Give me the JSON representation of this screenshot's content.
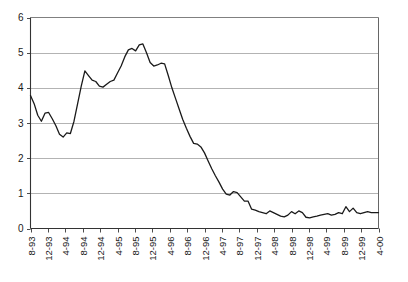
{
  "chart_data": {
    "type": "line",
    "title": "",
    "subtitle": "",
    "xlabel": "",
    "ylabel": "",
    "ylim": [
      0,
      6
    ],
    "ytick_labels": [
      "0",
      "1",
      "2",
      "3",
      "4",
      "5",
      "6"
    ],
    "ytick_values": [
      0,
      1,
      2,
      3,
      4,
      5,
      6
    ],
    "grid": true,
    "grid_axis": "y",
    "legend": false,
    "legend_position": "none",
    "line_color": "#1a1a1a",
    "grid_color": "#b3b3b3",
    "axis_color": "#4d4d4d",
    "background_color": "#ffffff",
    "x_tick_labels": [
      "8-93",
      "12-93",
      "4-94",
      "8-94",
      "12-94",
      "4-95",
      "8-95",
      "12-95",
      "4-96",
      "8-96",
      "12-96",
      "4-97",
      "8-97",
      "12-97",
      "4-98",
      "8-98",
      "12-98",
      "4-99",
      "8-99",
      "12-99",
      "4-00"
    ],
    "x_tick_label_rotation": -90,
    "series": [
      {
        "name": "series-1",
        "values": [
          3.78,
          3.55,
          3.22,
          3.05,
          3.28,
          3.3,
          3.12,
          2.92,
          2.68,
          2.6,
          2.72,
          2.7,
          3.05,
          3.55,
          4.05,
          4.48,
          4.35,
          4.22,
          4.18,
          4.05,
          4.02,
          4.1,
          4.18,
          4.22,
          4.42,
          4.62,
          4.88,
          5.08,
          5.12,
          5.05,
          5.22,
          5.25,
          5.0,
          4.72,
          4.62,
          4.65,
          4.7,
          4.68,
          4.35,
          4.0,
          3.7,
          3.4,
          3.1,
          2.85,
          2.62,
          2.42,
          2.4,
          2.32,
          2.15,
          1.92,
          1.7,
          1.5,
          1.32,
          1.12,
          0.98,
          0.95,
          1.05,
          1.02,
          0.9,
          0.78,
          0.78,
          0.55,
          0.52,
          0.48,
          0.45,
          0.42,
          0.5,
          0.45,
          0.4,
          0.35,
          0.33,
          0.38,
          0.48,
          0.42,
          0.5,
          0.45,
          0.32,
          0.3,
          0.33,
          0.35,
          0.38,
          0.4,
          0.42,
          0.38,
          0.4,
          0.45,
          0.42,
          0.62,
          0.48,
          0.58,
          0.45,
          0.42,
          0.45,
          0.48,
          0.45,
          0.45,
          0.45
        ]
      }
    ]
  }
}
